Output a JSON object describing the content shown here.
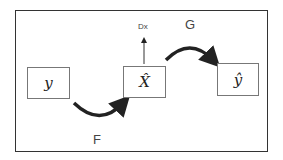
{
  "diagram": {
    "nodes": [
      {
        "id": "y",
        "label": "y"
      },
      {
        "id": "x_hat",
        "label": "X̂"
      },
      {
        "id": "y_hat",
        "label": "ŷ"
      }
    ],
    "edges": [
      {
        "from": "y",
        "to": "x_hat",
        "label": "F"
      },
      {
        "from": "x_hat",
        "to": "y_hat",
        "label": "G"
      },
      {
        "from": "x_hat",
        "to": "Dx",
        "label": "Dx"
      }
    ],
    "labels": {
      "F": "F",
      "G": "G",
      "Dx": "Dx"
    }
  }
}
